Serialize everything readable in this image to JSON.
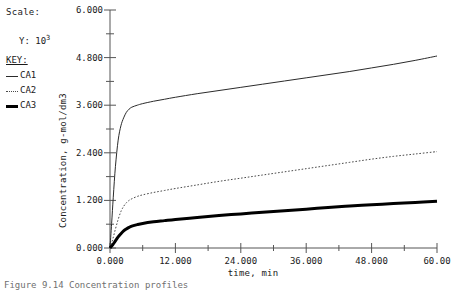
{
  "scale": {
    "label": "Scale:",
    "y_prefix": "Y:",
    "y_mantissa": "10",
    "y_exponent": "3"
  },
  "key": {
    "title": "KEY:",
    "entries": [
      {
        "label": "CA1",
        "style": "solid-thin",
        "color": "#2b2b2b"
      },
      {
        "label": "CA2",
        "style": "dotted",
        "color": "#4a4a4a"
      },
      {
        "label": "CA3",
        "style": "solid-thick",
        "color": "#000000"
      }
    ]
  },
  "caption": "Figure 9.14  Concentration profiles",
  "chart_data": {
    "type": "line",
    "title": "",
    "xlabel": "time, min",
    "ylabel": "Concentration, g-mol/dm3",
    "xlim": [
      0,
      60
    ],
    "ylim": [
      0,
      6
    ],
    "grid": false,
    "legend_position": "left-outside",
    "x_ticks": [
      "0.000",
      "12.000",
      "24.000",
      "36.000",
      "48.000",
      "60.00"
    ],
    "x_tick_values": [
      0,
      12,
      24,
      36,
      48,
      60
    ],
    "y_ticks": [
      "0.000",
      "1.200",
      "2.400",
      "3.600",
      "4.800",
      "6.000"
    ],
    "y_tick_values": [
      0,
      1.2,
      2.4,
      3.6,
      4.8,
      6.0
    ],
    "x_minor_ticks": [
      6,
      18,
      30,
      42,
      54
    ],
    "y_minor_ticks": [
      0.6,
      1.8,
      3.0,
      4.2,
      5.4
    ],
    "series": [
      {
        "name": "CA1",
        "style": "solid-thin",
        "color": "#2b2b2b",
        "width": 1,
        "x": [
          0,
          0.3,
          0.6,
          1.0,
          1.5,
          2.0,
          2.5,
          3.0,
          3.5,
          4.0,
          5.0,
          6.0,
          8.0,
          10.0,
          12.0,
          16.0,
          20.0,
          24.0,
          28.0,
          32.0,
          36.0,
          40.0,
          44.0,
          48.0,
          52.0,
          56.0,
          60.0
        ],
        "y": [
          0.0,
          0.62,
          1.28,
          2.06,
          2.72,
          3.08,
          3.28,
          3.42,
          3.5,
          3.55,
          3.6,
          3.64,
          3.7,
          3.75,
          3.8,
          3.89,
          3.97,
          4.05,
          4.13,
          4.21,
          4.29,
          4.37,
          4.45,
          4.54,
          4.63,
          4.73,
          4.84
        ]
      },
      {
        "name": "CA2",
        "style": "dotted",
        "color": "#4a4a4a",
        "width": 1,
        "x": [
          0,
          0.5,
          1.0,
          1.5,
          2.0,
          2.5,
          3.0,
          3.5,
          4.0,
          5.0,
          6.0,
          8.0,
          10.0,
          12.0,
          16.0,
          20.0,
          24.0,
          28.0,
          32.0,
          36.0,
          40.0,
          44.0,
          48.0,
          52.0,
          56.0,
          60.0
        ],
        "y": [
          0.0,
          0.22,
          0.48,
          0.72,
          0.92,
          1.05,
          1.14,
          1.2,
          1.24,
          1.3,
          1.34,
          1.4,
          1.45,
          1.5,
          1.59,
          1.68,
          1.76,
          1.84,
          1.92,
          2.0,
          2.08,
          2.16,
          2.24,
          2.31,
          2.37,
          2.43
        ]
      },
      {
        "name": "CA3",
        "style": "solid-thick",
        "color": "#000000",
        "width": 3,
        "x": [
          0,
          0.5,
          1.0,
          1.5,
          2.0,
          2.5,
          3.0,
          3.5,
          4.0,
          5.0,
          6.0,
          8.0,
          10.0,
          12.0,
          16.0,
          20.0,
          24.0,
          28.0,
          32.0,
          36.0,
          40.0,
          44.0,
          48.0,
          52.0,
          56.0,
          60.0
        ],
        "y": [
          0.0,
          0.08,
          0.18,
          0.28,
          0.36,
          0.43,
          0.48,
          0.52,
          0.55,
          0.59,
          0.62,
          0.66,
          0.69,
          0.72,
          0.77,
          0.82,
          0.86,
          0.9,
          0.94,
          0.98,
          1.02,
          1.06,
          1.09,
          1.12,
          1.15,
          1.18
        ]
      }
    ]
  }
}
